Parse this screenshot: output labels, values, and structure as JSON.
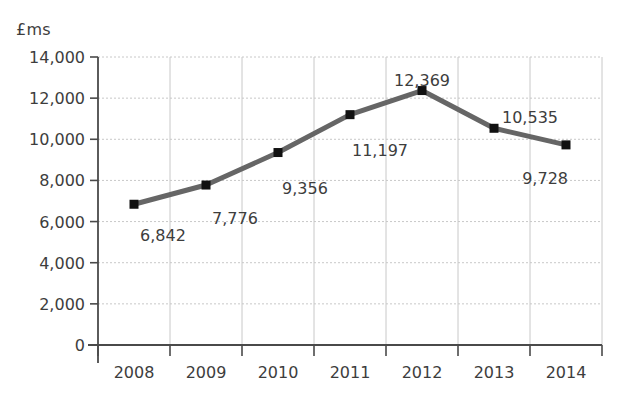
{
  "chart_data": {
    "type": "line",
    "title": "",
    "subtitle": "",
    "xlabel": "",
    "ylabel": "£ms",
    "categories": [
      "2008",
      "2009",
      "2010",
      "2011",
      "2012",
      "2013",
      "2014"
    ],
    "values": [
      6842,
      7776,
      9356,
      11197,
      12369,
      10535,
      9728
    ],
    "point_labels": [
      "6,842",
      "7,776",
      "9,356",
      "11,197",
      "12,369",
      "10,535",
      "9,728"
    ],
    "ylim": [
      0,
      14000
    ],
    "ytick_values": [
      0,
      2000,
      4000,
      6000,
      8000,
      10000,
      12000,
      14000
    ],
    "ytick_labels": [
      "0",
      "2,000",
      "4,000",
      "6,000",
      "8,000",
      "10,000",
      "12,000",
      "14,000"
    ],
    "grid": true,
    "legend": false,
    "legend_position": "none",
    "series": [
      {
        "name": "",
        "values": [
          6842,
          7776,
          9356,
          11197,
          12369,
          10535,
          9728
        ]
      }
    ],
    "colors": {
      "line": "#666666",
      "marker": "#111111",
      "grid": "#c8c8c8",
      "axis": "#4a4a4a",
      "text": "#3d3d3d",
      "background": "#ffffff"
    },
    "label_offsets": [
      {
        "dx": 6,
        "dy": 30,
        "anchor": "start"
      },
      {
        "dx": 6,
        "dy": 32,
        "anchor": "start"
      },
      {
        "dx": 4,
        "dy": 34,
        "anchor": "start"
      },
      {
        "dx": 2,
        "dy": 34,
        "anchor": "start"
      },
      {
        "dx": 0,
        "dy": -12,
        "anchor": "mid"
      },
      {
        "dx": 8,
        "dy": -12,
        "anchor": "start"
      },
      {
        "dx": 2,
        "dy": 32,
        "anchor": "end"
      }
    ]
  }
}
